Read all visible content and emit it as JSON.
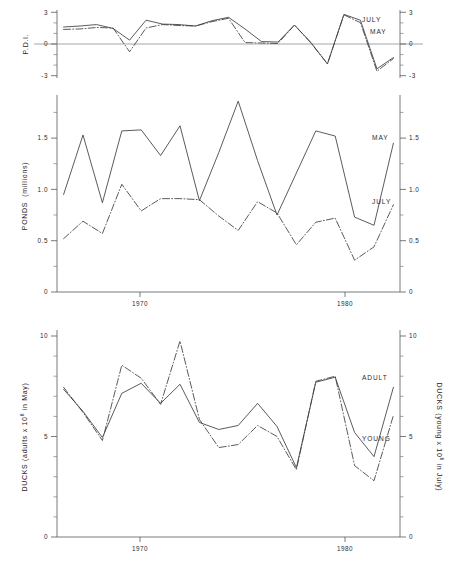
{
  "figure": {
    "width": 452,
    "height": 565,
    "background": "#ffffff",
    "ink_color": "#3b3d40"
  },
  "chart_data": [
    {
      "id": "panel-pdi",
      "type": "line",
      "title": "",
      "xlabel": "",
      "ylabel": "P.D.I.",
      "ylabel_right": "",
      "xlim": [
        1962.6,
        1983.4
      ],
      "ylim": [
        -3.6,
        3.4
      ],
      "yticks": [
        -3,
        0,
        3
      ],
      "ytick_labels": [
        "-3",
        "0",
        "3"
      ],
      "yticks_minor": [
        -2,
        -1,
        1,
        2
      ],
      "xticks": [
        1970,
        1980
      ],
      "xtick_labels": [
        "1970",
        "1980"
      ],
      "grid": false,
      "zero_line": true,
      "legend_position": "right-inline",
      "x": [
        1963,
        1964,
        1965,
        1966,
        1967,
        1968,
        1969,
        1970,
        1971,
        1972,
        1973,
        1974,
        1975,
        1976,
        1977,
        1978,
        1979,
        1980,
        1981,
        1982,
        1983
      ],
      "series": [
        {
          "name": "JULY",
          "style": "solid",
          "values": [
            1.65,
            1.75,
            1.9,
            1.5,
            0.3,
            2.35,
            1.95,
            1.9,
            1.75,
            2.3,
            2.65,
            1.45,
            0.15,
            0.1,
            1.85,
            0.05,
            -2.15,
            2.95,
            2.35,
            -2.65,
            -1.5
          ]
        },
        {
          "name": "MAY",
          "style": "dash-dot",
          "values": [
            1.4,
            1.45,
            1.6,
            1.55,
            -0.9,
            1.55,
            1.9,
            1.8,
            1.75,
            2.2,
            2.55,
            0.05,
            0.0,
            -0.05,
            1.85,
            0.0,
            -2.15,
            2.9,
            2.1,
            -2.9,
            -1.6
          ]
        }
      ]
    },
    {
      "id": "panel-ponds",
      "type": "line",
      "title": "",
      "xlabel": "",
      "ylabel": "PONDS  (millions)",
      "ylabel_right": "",
      "xlim": [
        1962.6,
        1983.4
      ],
      "ylim": [
        0,
        1.92
      ],
      "yticks": [
        0,
        0.5,
        1.0,
        1.5
      ],
      "ytick_labels": [
        "0",
        "0.5",
        "1.0",
        "1.5"
      ],
      "yticks_minor": [
        0.25,
        0.75,
        1.25,
        1.75
      ],
      "xticks": [
        1970,
        1980
      ],
      "xtick_labels": [
        "1970",
        "1980"
      ],
      "grid": false,
      "zero_line": false,
      "legend_position": "right-inline",
      "x": [
        1963,
        1964,
        1965,
        1966,
        1967,
        1968,
        1969,
        1970,
        1971,
        1972,
        1973,
        1974,
        1975,
        1976,
        1977,
        1978,
        1979,
        1980,
        1981,
        1982,
        1983
      ],
      "series": [
        {
          "name": "MAY",
          "style": "solid",
          "values": [
            0.95,
            1.53,
            0.87,
            1.57,
            1.58,
            1.33,
            1.62,
            0.89,
            1.36,
            1.86,
            1.28,
            0.75,
            1.16,
            1.57,
            1.52,
            0.73,
            0.65,
            1.45
          ]
        },
        {
          "name": "JULY",
          "style": "dash-dot",
          "values": [
            0.52,
            0.69,
            0.57,
            1.05,
            0.79,
            0.91,
            0.91,
            0.9,
            0.74,
            0.6,
            0.88,
            0.77,
            0.46,
            0.68,
            0.72,
            0.31,
            0.44,
            0.85
          ]
        }
      ]
    },
    {
      "id": "panel-ducks",
      "type": "line",
      "title": "",
      "xlabel": "",
      "ylabel": "DUCKS (adults x 10^6 in May)",
      "ylabel_right": "DUCKS (young x 10^6 in July)",
      "xlim": [
        1962.6,
        1983.4
      ],
      "ylim": [
        0,
        10.3
      ],
      "yticks": [
        0,
        5,
        10
      ],
      "ytick_labels": [
        "0",
        "5",
        "10"
      ],
      "yticks_minor": [
        1,
        2,
        3,
        4,
        6,
        7,
        8,
        9
      ],
      "xticks": [
        1970,
        1980
      ],
      "xtick_labels": [
        "1970",
        "1980"
      ],
      "grid": false,
      "zero_line": false,
      "legend_position": "right-inline",
      "x": [
        1963,
        1964,
        1965,
        1966,
        1967,
        1968,
        1969,
        1970,
        1971,
        1972,
        1973,
        1974,
        1975,
        1976,
        1977,
        1978,
        1979,
        1980,
        1981,
        1982,
        1983
      ],
      "series": [
        {
          "name": "ADULT",
          "style": "solid",
          "values": [
            7.35,
            6.25,
            4.95,
            7.15,
            7.65,
            6.65,
            7.6,
            5.7,
            5.35,
            5.55,
            6.65,
            5.5,
            3.45,
            7.7,
            7.95,
            5.2,
            4.0,
            7.45
          ]
        },
        {
          "name": "YOUNG",
          "style": "dash-dot",
          "values": [
            7.45,
            6.2,
            4.8,
            8.55,
            7.9,
            6.6,
            9.75,
            5.85,
            4.45,
            4.6,
            5.55,
            5.0,
            3.35,
            7.75,
            8.0,
            3.55,
            2.8,
            6.05
          ]
        }
      ]
    }
  ],
  "labels": {
    "pdi_axis_title": "P.D.I.",
    "pdi_tick_top": "3",
    "pdi_tick_zero": "0",
    "pdi_tick_bottom": "-3",
    "pdi_series_july": "JULY",
    "pdi_series_may": "MAY",
    "ponds_axis_title_main": "PONDS",
    "ponds_axis_title_unit": "(millions)",
    "ponds_tick_0": "0",
    "ponds_tick_05": "0.5",
    "ponds_tick_10": "1.0",
    "ponds_tick_15": "1.5",
    "ponds_series_may": "MAY",
    "ponds_series_july": "JULY",
    "ducks_axis_title_left_a": "DUCKS (adults x 10",
    "ducks_axis_title_left_sup": "6",
    "ducks_axis_title_left_b": " in May)",
    "ducks_axis_title_right_a": "DUCKS (young x 10",
    "ducks_axis_title_right_sup": "6",
    "ducks_axis_title_right_b": " in July)",
    "ducks_tick_0": "0",
    "ducks_tick_5": "5",
    "ducks_tick_10": "10",
    "ducks_series_adult": "ADULT",
    "ducks_series_young": "YOUNG",
    "xtick_1970": "1970",
    "xtick_1980": "1980"
  }
}
